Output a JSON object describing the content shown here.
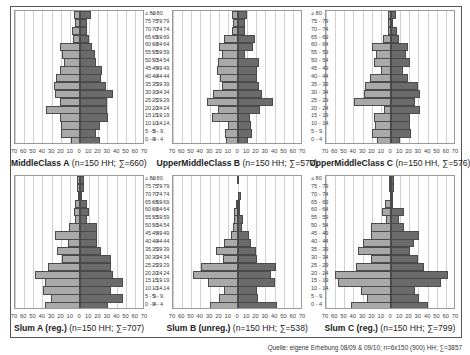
{
  "age_groups": [
    "≥ 80",
    "75 - 79",
    "70 - 74",
    "65 - 69",
    "60 - 64",
    "55 - 59",
    "50 - 54",
    "45 - 49",
    "40 - 44",
    "35 - 39",
    "30 - 34",
    "25 - 29",
    "20 - 24",
    "15 - 19",
    "10 - 14.",
    "5 - 9.",
    "0 - 4"
  ],
  "axis_ticks": [
    "70",
    "60",
    "50",
    "40",
    "30",
    "20",
    "10",
    "0",
    "10",
    "20",
    "30",
    "40",
    "50",
    "60",
    "70"
  ],
  "source": "Quelle: eigene Erhebung 08/09 & 09/10; n=6x150 (900) HH; ∑=3857",
  "colors": {
    "left_bar": "#a9a9a9",
    "right_bar": "#6b6b6b",
    "grid": "#d0d0d0",
    "frame": "#555555"
  },
  "chart_data": [
    {
      "type": "bar",
      "orientation": "horizontal",
      "subtype": "population-pyramid",
      "title_bold": "MiddleClass A",
      "title_rest": " (n=150 HH; ∑=660)",
      "categories": [
        "≥ 80",
        "75 - 79",
        "70 - 74",
        "65 - 69",
        "60 - 64",
        "55 - 59",
        "50 - 54",
        "45 - 49",
        "40 - 44",
        "35 - 39",
        "30 - 34",
        "25 - 29",
        "20 - 24",
        "15 - 19",
        "10 - 14.",
        "5 - 9.",
        "0 - 4"
      ],
      "xlim": [
        -70,
        70
      ],
      "series": [
        {
          "name": "left",
          "values": [
            6,
            5,
            9,
            8,
            22,
            19,
            17,
            22,
            26,
            28,
            27,
            22,
            37,
            22,
            20,
            21,
            10
          ]
        },
        {
          "name": "right",
          "values": [
            12,
            8,
            8,
            10,
            13,
            16,
            17,
            24,
            23,
            28,
            35,
            29,
            29,
            30,
            22,
            17,
            21
          ]
        }
      ]
    },
    {
      "type": "bar",
      "orientation": "horizontal",
      "subtype": "population-pyramid",
      "title_bold": "UpperMiddleClass B",
      "title_rest": " (n=150 HH; ∑=577)",
      "categories": [
        "≥ 80",
        "75 - 79",
        "70 - 74",
        "65 - 69",
        "60 - 64",
        "55 - 59",
        "50 - 54",
        "45 - 49",
        "40 - 44",
        "35 - 39",
        "30 - 34",
        "25 - 29",
        "20 - 24",
        "15 - 19",
        "10 - 14.",
        "5 - 9.",
        "0 - 4"
      ],
      "xlim": [
        -70,
        70
      ],
      "series": [
        {
          "name": "left",
          "values": [
            7,
            5,
            6,
            15,
            21,
            17,
            22,
            23,
            19,
            17,
            27,
            33,
            22,
            28,
            11,
            14,
            13
          ]
        },
        {
          "name": "right",
          "values": [
            10,
            7,
            7,
            18,
            16,
            7,
            23,
            20,
            20,
            23,
            26,
            38,
            24,
            13,
            14,
            15,
            11
          ]
        }
      ]
    },
    {
      "type": "bar",
      "orientation": "horizontal",
      "subtype": "population-pyramid",
      "title_bold": "UpperMiddleClass C",
      "title_rest": " (n=150 HH, ∑=576)",
      "categories": [
        "≥ 80",
        "75 - 79",
        "70 - 74",
        "65 - 69",
        "60 - 64",
        "55 - 59",
        "50 - 54",
        "45 - 49",
        "40 - 44",
        "35 - 39",
        "30 - 34",
        "25 - 29",
        "20 - 24",
        "15 - 19",
        "10 - 14.",
        "5 - 9.",
        "0 - 4"
      ],
      "xlim": [
        -70,
        70
      ],
      "series": [
        {
          "name": "left",
          "values": [
            3,
            3,
            3,
            9,
            20,
            16,
            18,
            11,
            23,
            28,
            29,
            40,
            8,
            18,
            17,
            20,
            15
          ]
        },
        {
          "name": "right",
          "values": [
            5,
            1,
            6,
            9,
            18,
            16,
            20,
            13,
            18,
            29,
            31,
            26,
            31,
            20,
            20,
            22,
            10
          ]
        }
      ]
    },
    {
      "type": "bar",
      "orientation": "horizontal",
      "subtype": "population-pyramid",
      "title_bold": "Slum  A (reg.)",
      "title_rest": " (n=150 HH; ∑=707)",
      "categories": [
        "≥ 80",
        "75 - 79",
        "70 - 74",
        "65 - 69",
        "60 - 64",
        "55 - 59",
        "50 - 54",
        "45 - 49",
        "40 - 44",
        "35 - 39",
        "30 - 34",
        "25 - 29",
        "20 - 24",
        "15 - 19",
        "10 - 14.",
        "5 - 9.",
        "0 - 4"
      ],
      "xlim": [
        -70,
        70
      ],
      "series": [
        {
          "name": "left",
          "values": [
            3,
            3,
            2,
            5,
            7,
            5,
            12,
            27,
            13,
            25,
            19,
            34,
            48,
            38,
            40,
            31,
            38
          ]
        },
        {
          "name": "right",
          "values": [
            4,
            4,
            2,
            7,
            10,
            7,
            18,
            18,
            18,
            23,
            33,
            33,
            36,
            46,
            33,
            46,
            30
          ]
        }
      ]
    },
    {
      "type": "bar",
      "orientation": "horizontal",
      "subtype": "population-pyramid",
      "title_bold": "Slum B (unreg.)",
      "title_rest": " (n=150 HH; ∑=538)",
      "categories": [
        "≥ 80",
        "75 - 79",
        "70 - 74",
        "65 - 69",
        "60 - 64",
        "55 - 59",
        "50 - 54",
        "45 - 49",
        "40 - 44",
        "35 - 39",
        "30 - 34",
        "25 - 29",
        "20 - 24",
        "15 - 19",
        "10 - 14.",
        "5 - 9.",
        "0 - 4"
      ],
      "xlim": [
        -70,
        70
      ],
      "series": [
        {
          "name": "left",
          "values": [
            1,
            0,
            0,
            2,
            4,
            4,
            5,
            8,
            15,
            24,
            16,
            40,
            49,
            32,
            15,
            21,
            30
          ]
        },
        {
          "name": "right",
          "values": [
            0,
            0,
            3,
            2,
            2,
            5,
            4,
            12,
            14,
            19,
            20,
            41,
            36,
            40,
            20,
            22,
            42
          ]
        }
      ]
    },
    {
      "type": "bar",
      "orientation": "horizontal",
      "subtype": "population-pyramid",
      "title_bold": "Slum C (reg.)",
      "title_rest": " (n=150 HH; ∑=799)",
      "categories": [
        "≥ 80",
        "75 - 79",
        "70 - 74",
        "65 - 69",
        "60 - 64",
        "55 - 59",
        "50 - 54",
        "45 - 49",
        "40 - 44",
        "35 - 39",
        "30 - 34",
        "25 - 29",
        "20 - 24",
        "15 - 19",
        "10 - 14.",
        "5 - 9.",
        "0 - 4"
      ],
      "xlim": [
        -70,
        70
      ],
      "series": [
        {
          "name": "left",
          "values": [
            2,
            2,
            1,
            6,
            10,
            5,
            22,
            22,
            30,
            36,
            22,
            38,
            60,
            57,
            32,
            26,
            43
          ]
        },
        {
          "name": "right",
          "values": [
            3,
            3,
            2,
            2,
            14,
            9,
            14,
            30,
            25,
            20,
            29,
            35,
            61,
            54,
            26,
            30,
            40
          ]
        }
      ]
    }
  ]
}
